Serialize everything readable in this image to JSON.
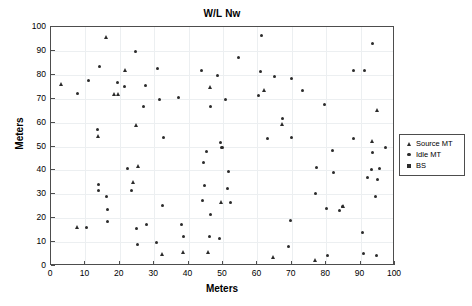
{
  "chart_data": {
    "type": "scatter",
    "title": "W/L Nw",
    "xlabel": "Meters",
    "ylabel": "Meters",
    "xlim": [
      0,
      100
    ],
    "ylim": [
      0,
      100
    ],
    "xticks": [
      0,
      10,
      20,
      30,
      40,
      50,
      60,
      70,
      80,
      90,
      100
    ],
    "yticks": [
      0,
      10,
      20,
      30,
      40,
      50,
      60,
      70,
      80,
      90,
      100
    ],
    "grid": true,
    "legend_position": "outside-right",
    "series": [
      {
        "name": "Source MT",
        "marker": "triangle",
        "color": "#2b2b2b",
        "points": [
          [
            3.2,
            76.0
          ],
          [
            7.8,
            16.0
          ],
          [
            13.9,
            54.1
          ],
          [
            16.2,
            95.8
          ],
          [
            18.6,
            71.6
          ],
          [
            19.6,
            71.7
          ],
          [
            21.6,
            81.8
          ],
          [
            24.0,
            34.8
          ],
          [
            25.0,
            58.7
          ],
          [
            25.4,
            41.8
          ],
          [
            32.4,
            4.8
          ],
          [
            38.4,
            5.6
          ],
          [
            45.8,
            5.7
          ],
          [
            46.3,
            74.7
          ],
          [
            49.6,
            26.5
          ],
          [
            62.0,
            73.6
          ],
          [
            64.8,
            3.5
          ],
          [
            67.2,
            59.3
          ],
          [
            77.0,
            2.5
          ],
          [
            85.0,
            24.8
          ],
          [
            93.5,
            52.1
          ],
          [
            94.8,
            65.2
          ]
        ]
      },
      {
        "name": "Idle MT",
        "marker": "dot",
        "color": "#2b2b2b",
        "points": [
          [
            7.6,
            72.0
          ],
          [
            10.3,
            16.0
          ],
          [
            10.8,
            77.8
          ],
          [
            13.6,
            57.0
          ],
          [
            13.8,
            33.9
          ],
          [
            13.9,
            31.5
          ],
          [
            14.1,
            83.6
          ],
          [
            16.0,
            28.9
          ],
          [
            16.3,
            23.7
          ],
          [
            16.4,
            18.8
          ],
          [
            19.4,
            76.9
          ],
          [
            21.4,
            74.9
          ],
          [
            22.2,
            40.8
          ],
          [
            23.3,
            31.6
          ],
          [
            24.6,
            89.6
          ],
          [
            24.8,
            15.8
          ],
          [
            25.0,
            8.9
          ],
          [
            26.8,
            66.9
          ],
          [
            27.4,
            75.7
          ],
          [
            27.8,
            17.5
          ],
          [
            30.8,
            9.8
          ],
          [
            31.0,
            82.6
          ],
          [
            31.6,
            69.8
          ],
          [
            32.3,
            25.5
          ],
          [
            32.8,
            53.8
          ],
          [
            37.0,
            70.6
          ],
          [
            38.0,
            17.5
          ],
          [
            38.6,
            12.4
          ],
          [
            43.8,
            81.6
          ],
          [
            44.0,
            27.5
          ],
          [
            44.3,
            43.5
          ],
          [
            44.6,
            33.5
          ],
          [
            45.3,
            47.8
          ],
          [
            46.0,
            12.3
          ],
          [
            46.3,
            21.5
          ],
          [
            46.5,
            66.8
          ],
          [
            48.3,
            79.6
          ],
          [
            49.0,
            11.6
          ],
          [
            49.4,
            51.5
          ],
          [
            49.5,
            49.7
          ],
          [
            49.8,
            49.5
          ],
          [
            50.8,
            69.6
          ],
          [
            51.2,
            32.3
          ],
          [
            51.6,
            39.5
          ],
          [
            52.3,
            26.6
          ],
          [
            54.6,
            87.4
          ],
          [
            60.2,
            71.4
          ],
          [
            60.8,
            81.4
          ],
          [
            61.2,
            96.3
          ],
          [
            62.8,
            53.5
          ],
          [
            65.0,
            79.2
          ],
          [
            67.3,
            61.6
          ],
          [
            69.8,
            78.4
          ],
          [
            70.0,
            53.6
          ],
          [
            69.6,
            19.1
          ],
          [
            69.0,
            8.3
          ],
          [
            73.2,
            73.4
          ],
          [
            76.8,
            30.3
          ],
          [
            77.2,
            41.4
          ],
          [
            79.6,
            67.5
          ],
          [
            80.1,
            24.0
          ],
          [
            80.4,
            4.2
          ],
          [
            81.8,
            48.4
          ],
          [
            82.0,
            39.2
          ],
          [
            84.0,
            23.2
          ],
          [
            84.8,
            25.0
          ],
          [
            87.8,
            82.0
          ],
          [
            88.0,
            53.4
          ],
          [
            90.6,
            14.0
          ],
          [
            90.8,
            5.2
          ],
          [
            91.0,
            82.0
          ],
          [
            92.0,
            37.2
          ],
          [
            93.2,
            40.5
          ],
          [
            93.4,
            47.3
          ],
          [
            93.6,
            93.2
          ],
          [
            94.2,
            29.2
          ],
          [
            94.5,
            4.2
          ],
          [
            95.0,
            36.2
          ],
          [
            95.4,
            41.0
          ],
          [
            97.2,
            49.4
          ]
        ]
      },
      {
        "name": "BS",
        "marker": "square",
        "color": "#2b2b2b",
        "points": []
      }
    ]
  },
  "legend": {
    "items": [
      {
        "label": "Source MT",
        "marker": "triangle"
      },
      {
        "label": "Idle MT",
        "marker": "dot"
      },
      {
        "label": "BS",
        "marker": "square"
      }
    ]
  }
}
